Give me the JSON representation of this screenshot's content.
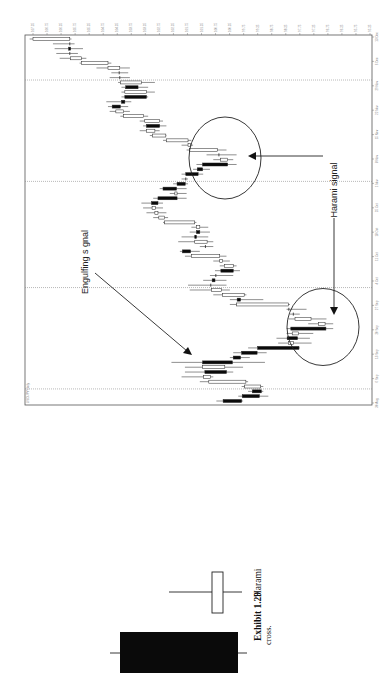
{
  "chart_data": {
    "type": "candlestick",
    "title": "",
    "orientation": "rotated-90-ccw",
    "header_text": "USD/JPY Daily",
    "xlabel": "Date",
    "ylabel": "Price",
    "ylim": [
      95.25,
      107.25
    ],
    "price_ticks": [
      "107.25",
      "106.75",
      "106.25",
      "105.75",
      "105.25",
      "104.75",
      "104.25",
      "103.75",
      "103.25",
      "102.75",
      "102.25",
      "101.75",
      "101.25",
      "100.75",
      "100.25",
      "99.75",
      "99.25",
      "98.75",
      "98.25",
      "97.75",
      "97.25",
      "96.75",
      "96.25",
      "95.75",
      "95.25"
    ],
    "date_ticks": [
      "30 Aug",
      "6 Sep",
      "13 Sep",
      "20 Sep",
      "27 Sep",
      "4 Oct",
      "11 Oct",
      "18 Oct",
      "25 Oct",
      "1 Nov",
      "8 Nov",
      "15 Nov",
      "22 Nov",
      "29 Nov",
      "6 Dec",
      "13 Dec"
    ],
    "grid": false,
    "marked_periods": [
      3,
      24,
      46,
      67
    ],
    "candles": [
      {
        "o": 100.48,
        "h": 100.72,
        "l": 99.77,
        "c": 99.82
      },
      {
        "o": 99.8,
        "h": 99.94,
        "l": 98.87,
        "c": 99.19
      },
      {
        "o": 99.44,
        "h": 99.59,
        "l": 99.05,
        "c": 99.12
      },
      {
        "o": 99.14,
        "h": 99.82,
        "l": 99.05,
        "c": 99.71
      },
      {
        "o": 99.67,
        "h": 101.31,
        "l": 99.59,
        "c": 100.99
      },
      {
        "o": 100.93,
        "h": 101.96,
        "l": 100.83,
        "c": 101.17
      },
      {
        "o": 101.13,
        "h": 101.84,
        "l": 100.12,
        "c": 100.36
      },
      {
        "o": 100.42,
        "h": 101.84,
        "l": 99.77,
        "c": 101.21
      },
      {
        "o": 101.21,
        "h": 102.32,
        "l": 98.99,
        "c": 100.15
      },
      {
        "o": 100.12,
        "h": 100.24,
        "l": 99.53,
        "c": 99.86
      },
      {
        "o": 99.82,
        "h": 100.12,
        "l": 98.93,
        "c": 99.27
      },
      {
        "o": 99.25,
        "h": 99.59,
        "l": 97.75,
        "c": 97.78
      },
      {
        "o": 97.98,
        "h": 98.52,
        "l": 97.33,
        "c": 98.16
      },
      {
        "o": 98.2,
        "h": 98.58,
        "l": 97.39,
        "c": 97.83
      },
      {
        "o": 97.79,
        "h": 98.22,
        "l": 97.27,
        "c": 98.02
      },
      {
        "o": 98.07,
        "h": 98.22,
        "l": 96.56,
        "c": 96.82
      },
      {
        "o": 96.85,
        "h": 97.45,
        "l": 96.56,
        "c": 97.09
      },
      {
        "o": 97.35,
        "h": 98.16,
        "l": 96.8,
        "c": 97.92
      },
      {
        "o": 97.98,
        "h": 98.1,
        "l": 97.75,
        "c": 97.98
      },
      {
        "o": 98.14,
        "h": 98.22,
        "l": 97.51,
        "c": 98.14
      },
      {
        "o": 98.16,
        "h": 100.24,
        "l": 98.1,
        "c": 100.0
      },
      {
        "o": 99.98,
        "h": 100.24,
        "l": 99.05,
        "c": 99.86
      },
      {
        "o": 99.73,
        "h": 100.83,
        "l": 99.65,
        "c": 100.5
      },
      {
        "o": 100.54,
        "h": 101.67,
        "l": 100.24,
        "c": 100.89
      },
      {
        "o": 100.92,
        "h": 101.73,
        "l": 100.36,
        "c": 100.92
      },
      {
        "o": 100.87,
        "h": 101.19,
        "l": 100.36,
        "c": 100.77
      },
      {
        "o": 100.74,
        "h": 100.95,
        "l": 100.12,
        "c": 100.74
      },
      {
        "o": 100.56,
        "h": 100.77,
        "l": 99.88,
        "c": 100.12
      },
      {
        "o": 100.12,
        "h": 100.6,
        "l": 100.0,
        "c": 100.44
      },
      {
        "o": 100.5,
        "h": 100.83,
        "l": 100.24,
        "c": 100.6
      },
      {
        "o": 100.6,
        "h": 101.84,
        "l": 100.36,
        "c": 101.61
      },
      {
        "o": 101.93,
        "h": 102.02,
        "l": 101.31,
        "c": 101.64
      },
      {
        "o": 101.11,
        "h": 101.31,
        "l": 100.83,
        "c": 101.11
      },
      {
        "o": 101.05,
        "h": 102.08,
        "l": 100.83,
        "c": 101.49
      },
      {
        "o": 101.49,
        "h": 101.96,
        "l": 101.01,
        "c": 101.43
      },
      {
        "o": 101.43,
        "h": 101.67,
        "l": 100.95,
        "c": 101.31
      },
      {
        "o": 101.31,
        "h": 101.61,
        "l": 101.01,
        "c": 101.43
      },
      {
        "o": 101.49,
        "h": 102.62,
        "l": 101.43,
        "c": 102.56
      },
      {
        "o": 102.56,
        "h": 102.97,
        "l": 102.44,
        "c": 102.77
      },
      {
        "o": 102.8,
        "h": 103.21,
        "l": 102.5,
        "c": 102.91
      },
      {
        "o": 102.89,
        "h": 103.33,
        "l": 102.62,
        "c": 103.01
      },
      {
        "o": 103.03,
        "h": 103.39,
        "l": 102.62,
        "c": 102.8
      },
      {
        "o": 102.8,
        "h": 102.97,
        "l": 101.78,
        "c": 102.12
      },
      {
        "o": 102.12,
        "h": 102.38,
        "l": 101.78,
        "c": 102.2
      },
      {
        "o": 102.62,
        "h": 102.74,
        "l": 101.78,
        "c": 102.14
      },
      {
        "o": 102.12,
        "h": 102.26,
        "l": 101.73,
        "c": 101.83
      },
      {
        "o": 101.81,
        "h": 101.96,
        "l": 101.73,
        "c": 101.81
      },
      {
        "o": 101.81,
        "h": 101.96,
        "l": 101.19,
        "c": 101.37
      },
      {
        "o": 101.4,
        "h": 101.55,
        "l": 100.95,
        "c": 101.21
      },
      {
        "o": 101.21,
        "h": 101.43,
        "l": 100.0,
        "c": 100.32
      },
      {
        "o": 100.32,
        "h": 100.83,
        "l": 100.12,
        "c": 100.57
      },
      {
        "o": 100.63,
        "h": 101.07,
        "l": 100.0,
        "c": 100.63
      },
      {
        "o": 100.69,
        "h": 101.78,
        "l": 100.36,
        "c": 101.67
      },
      {
        "o": 101.64,
        "h": 101.96,
        "l": 101.55,
        "c": 101.73
      },
      {
        "o": 101.73,
        "h": 102.62,
        "l": 101.61,
        "c": 102.5
      },
      {
        "o": 102.52,
        "h": 103.09,
        "l": 102.5,
        "c": 103.0
      },
      {
        "o": 102.91,
        "h": 103.45,
        "l": 102.74,
        "c": 103.21
      },
      {
        "o": 103.21,
        "h": 103.33,
        "l": 102.5,
        "c": 102.74
      },
      {
        "o": 102.74,
        "h": 103.45,
        "l": 102.62,
        "c": 103.27
      },
      {
        "o": 103.31,
        "h": 104.14,
        "l": 103.15,
        "c": 104.02
      },
      {
        "o": 104.02,
        "h": 104.52,
        "l": 103.8,
        "c": 104.3
      },
      {
        "o": 104.43,
        "h": 104.58,
        "l": 103.86,
        "c": 104.14
      },
      {
        "o": 104.1,
        "h": 104.64,
        "l": 103.75,
        "c": 103.98
      },
      {
        "o": 103.98,
        "h": 104.1,
        "l": 103.15,
        "c": 103.21
      },
      {
        "o": 103.21,
        "h": 104.1,
        "l": 102.91,
        "c": 103.98
      },
      {
        "o": 103.95,
        "h": 104.1,
        "l": 103.15,
        "c": 103.51
      },
      {
        "o": 103.39,
        "h": 104.22,
        "l": 102.91,
        "c": 104.14
      },
      {
        "o": 104.16,
        "h": 104.52,
        "l": 103.8,
        "c": 104.16
      },
      {
        "o": 104.18,
        "h": 104.46,
        "l": 103.86,
        "c": 104.18
      },
      {
        "o": 104.16,
        "h": 104.99,
        "l": 103.8,
        "c": 104.58
      },
      {
        "o": 104.58,
        "h": 105.59,
        "l": 104.46,
        "c": 105.53
      },
      {
        "o": 105.53,
        "h": 106.3,
        "l": 105.35,
        "c": 105.92
      },
      {
        "o": 105.94,
        "h": 106.42,
        "l": 105.65,
        "c": 105.94
      },
      {
        "o": 105.98,
        "h": 106.48,
        "l": 105.47,
        "c": 105.91
      },
      {
        "o": 105.94,
        "h": 106.54,
        "l": 105.77,
        "c": 105.94
      },
      {
        "o": 105.94,
        "h": 107.37,
        "l": 105.88,
        "c": 107.25
      }
    ],
    "annotations": [
      {
        "text": "Engulfing s gnal",
        "target": "engulfing pattern near start of series"
      },
      {
        "text": "Harami signal",
        "target": "two harami patterns (circled)"
      }
    ]
  },
  "illustration": {
    "pattern": "harami cross",
    "candles": [
      {
        "color": "black",
        "size": "large"
      },
      {
        "color": "white",
        "size": "small"
      }
    ]
  },
  "caption": {
    "label": "Exhibit 1.29",
    "title": "Harami",
    "continuation": "cross."
  }
}
